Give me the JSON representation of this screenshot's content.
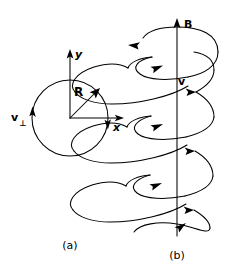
{
  "figure": {
    "background_color": "#ffffff",
    "line_color": "#000000",
    "width": 239,
    "height": 266
  },
  "panel_a": {
    "caption": "(a)",
    "description": "Circular orbit projected in the plane perpendicular to B",
    "axes": {
      "x_label": "x",
      "y_label": "y"
    },
    "radius_label": "R",
    "velocity_label": "v",
    "velocity_subscript": "⊥",
    "rotation_sense": "counterclockwise",
    "center": {
      "x": 70,
      "y": 118
    },
    "circle_radius": 38
  },
  "panel_b": {
    "caption": "(b)",
    "description": "Helical trajectory about the magnetic field axis",
    "field_label": "B",
    "velocity_label": "v",
    "axis_direction": "up",
    "turns": 4,
    "axis_x": 177,
    "axis_top": 18,
    "axis_bottom": 236
  }
}
